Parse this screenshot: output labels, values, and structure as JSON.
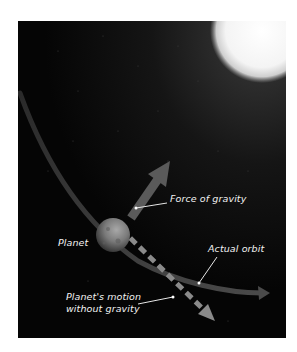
{
  "diagram": {
    "nodes": [
      {
        "id": "star",
        "label": "",
        "type": "star"
      },
      {
        "id": "planet",
        "label": "Planet",
        "type": "planet"
      }
    ],
    "edges": [
      {
        "id": "gravity",
        "from": "planet",
        "to": "star",
        "label": "Force of gravity",
        "style": "solid-thick-arrow"
      },
      {
        "id": "orbit",
        "from": "planet",
        "label": "Actual orbit",
        "style": "curved-arrow"
      },
      {
        "id": "inertia",
        "from": "planet",
        "label": "Planet's motion without gravity",
        "style": "dashed-arrow"
      }
    ]
  },
  "labels": {
    "planet": "Planet",
    "force_of_gravity": "Force of gravity",
    "actual_orbit": "Actual orbit",
    "motion_line1": "Planet's motion",
    "motion_line2": "without gravity"
  },
  "colors": {
    "background": "#050505",
    "star": "#ffffff",
    "gravity_arrow": "#5a5a5a",
    "orbit_path": "#3a3a3a",
    "dashed_arrow": "#8a8a8a",
    "label_text": "#f2f2f2"
  }
}
